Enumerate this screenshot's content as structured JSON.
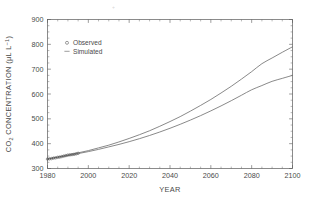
{
  "figure": {
    "background_color": "#ffffff",
    "axis_color": "#5a5a5a",
    "curve_color": "#6b6b6b"
  },
  "legend": {
    "position": "upper-left-inside",
    "entries": [
      {
        "label": "Observed",
        "marker": "circle",
        "symbol": "o"
      },
      {
        "label": "Simulated",
        "marker": "line",
        "symbol": "–"
      }
    ]
  },
  "axis": {
    "x_title": "YEAR",
    "y_title_main": "CO",
    "y_title_sub": "2",
    "y_title_rest": " CONCENTRATION (",
    "y_title_mu": "μ",
    "y_title_units": "L L",
    "y_title_exp": "−1",
    "y_title_close": ")",
    "y_title_full": "CO2 CONCENTRATION (μL L−1)",
    "x_ticklabels": [
      "1980",
      "2000",
      "2020",
      "2040",
      "2060",
      "2080",
      "2100"
    ],
    "y_ticklabels": [
      "300",
      "400",
      "500",
      "600",
      "700",
      "800",
      "900"
    ]
  },
  "chart_data": {
    "type": "line",
    "title": "",
    "subtitle": "",
    "xlabel": "YEAR",
    "ylabel": "CO2 CONCENTRATION (μL L−1)",
    "xlim": [
      1980,
      2100
    ],
    "ylim": [
      300,
      900
    ],
    "xticks": [
      1980,
      2000,
      2020,
      2040,
      2060,
      2080,
      2100
    ],
    "yticks": [
      300,
      400,
      500,
      600,
      700,
      800,
      900
    ],
    "x_minor_interval": 5,
    "y_minor_interval": 25,
    "grid": false,
    "frame": "full-box",
    "tick_direction": "in",
    "legend_entries": [
      "Observed",
      "Simulated"
    ],
    "legend_position": "upper left",
    "annotations": [],
    "series": [
      {
        "name": "Simulated (high scenario)",
        "kind": "line",
        "x": [
          1980,
          1985,
          1990,
          1995,
          2000,
          2005,
          2010,
          2015,
          2020,
          2025,
          2030,
          2035,
          2040,
          2045,
          2050,
          2055,
          2060,
          2065,
          2070,
          2075,
          2080,
          2085,
          2090,
          2095,
          2100
        ],
        "values": [
          338,
          346,
          354,
          363,
          372,
          383,
          394,
          407,
          421,
          436,
          452,
          470,
          489,
          509,
          531,
          554,
          578,
          604,
          631,
          660,
          690,
          722,
          745,
          768,
          790
        ]
      },
      {
        "name": "Simulated (low scenario)",
        "kind": "line",
        "x": [
          1980,
          1985,
          1990,
          1995,
          2000,
          2005,
          2010,
          2015,
          2020,
          2025,
          2030,
          2035,
          2040,
          2045,
          2050,
          2055,
          2060,
          2065,
          2070,
          2075,
          2080,
          2085,
          2090,
          2095,
          2100
        ],
        "values": [
          338,
          345,
          352,
          360,
          368,
          377,
          387,
          397,
          408,
          420,
          433,
          447,
          462,
          478,
          495,
          513,
          532,
          552,
          573,
          595,
          617,
          634,
          651,
          663,
          675
        ]
      },
      {
        "name": "Observed",
        "kind": "scatter",
        "marker": "circle",
        "x": [
          1980,
          1981,
          1982,
          1983,
          1984,
          1985,
          1986,
          1987,
          1988,
          1989,
          1990,
          1991,
          1992,
          1993,
          1994,
          1995
        ],
        "values": [
          338,
          339,
          340,
          342,
          343,
          345,
          346,
          348,
          350,
          352,
          354,
          355,
          356,
          357,
          359,
          361
        ]
      }
    ]
  }
}
